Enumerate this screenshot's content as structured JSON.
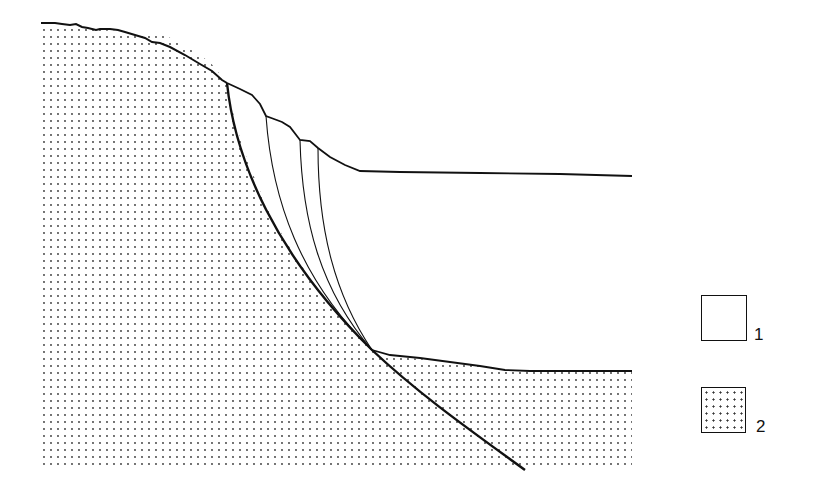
{
  "diagram": {
    "type": "geological cross-section",
    "colors": {
      "line": "#111111",
      "stipple": "#333333",
      "background": "#ffffff"
    },
    "elements": {
      "bedrock_unit": "stippled mass (unit 2) on left and beneath lower surface",
      "slumped_mass": "unstippled mass (unit 1) between main slip surface and upper terrace",
      "main_slip_surface": "bold concave curve from scarp crest down to toe, continuing below lower surface",
      "internal_slip_surfaces_count": 3
    }
  },
  "legend": {
    "items": [
      {
        "id": "1",
        "label": "1",
        "pattern": "blank"
      },
      {
        "id": "2",
        "label": "2",
        "pattern": "stipple"
      }
    ]
  }
}
